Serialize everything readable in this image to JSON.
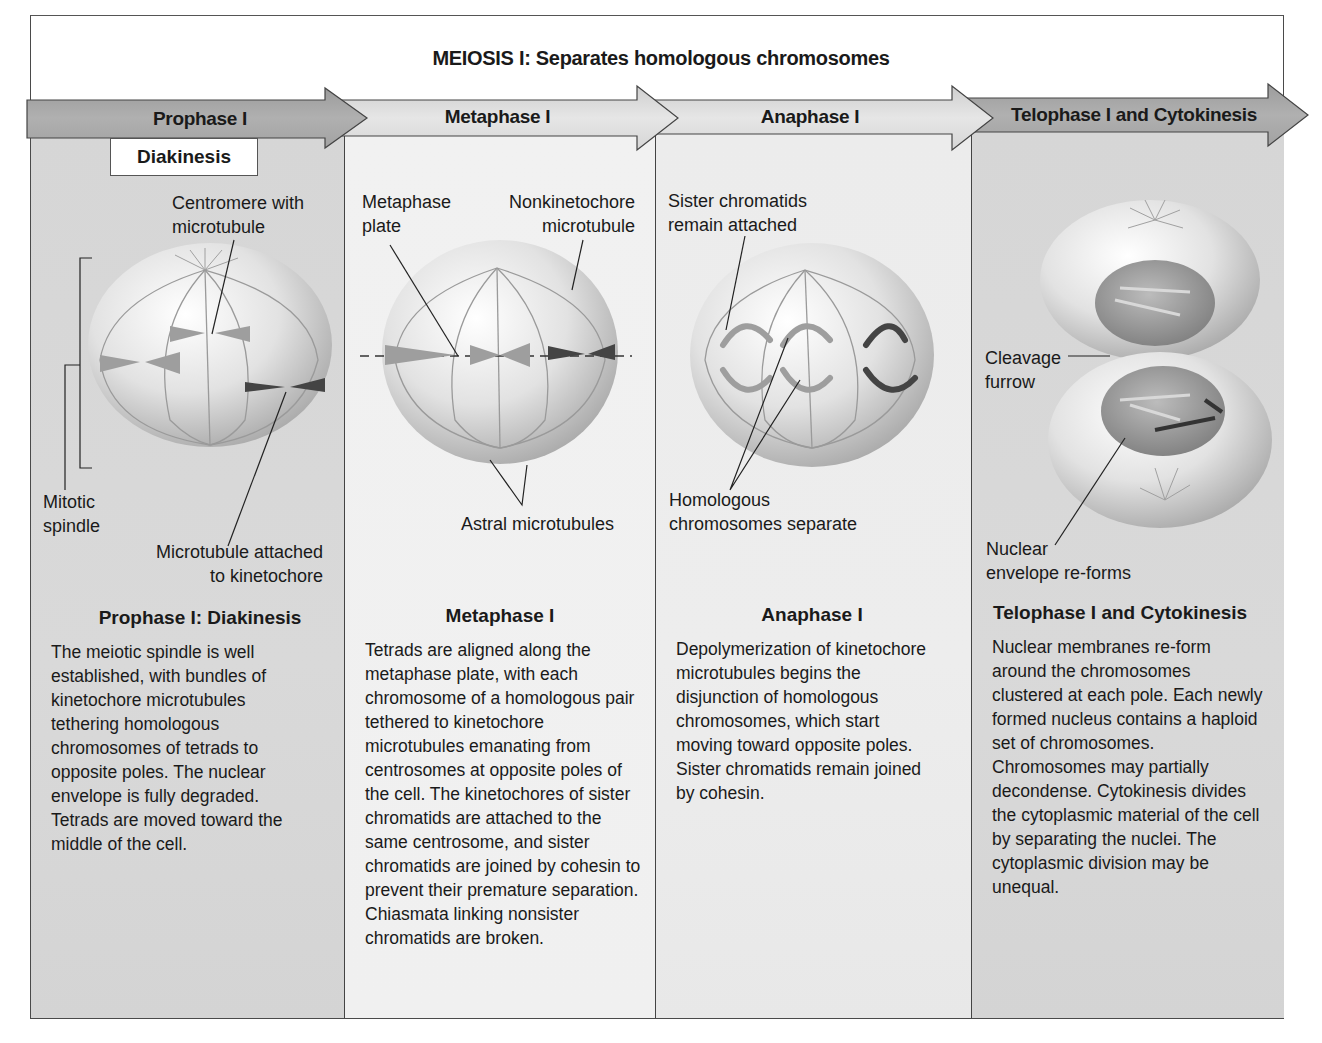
{
  "figure": {
    "title": "MEIOSIS I: Separates homologous chromosomes",
    "colors": {
      "frame_border": "#4a4a4a",
      "banner_dark": "#a9a9a9",
      "banner_light": "#dcdcdc",
      "column_dark": "#d6d6d6",
      "column_light": "#ececec",
      "text": "#1a1a1a"
    }
  },
  "stages": [
    {
      "banner": "Prophase I",
      "substage": "Diakinesis",
      "labels": {
        "centromere": "Centromere with\nmicrotubule",
        "spindle": "Mitotic\nspindle",
        "kinetochore": "Microtubule attached\nto kinetochore"
      },
      "desc_title": "Prophase I: Diakinesis",
      "desc": "The meiotic spindle is well established, with bundles of kinetochore microtubules tethering homologous chromosomes of tetrads to opposite poles. The nuclear envelope is fully degraded. Tetrads are moved toward the middle of the cell."
    },
    {
      "banner": "Metaphase I",
      "labels": {
        "plate": "Metaphase\nplate",
        "nonkinetochore": "Nonkinetochore\nmicrotubule",
        "astral": "Astral microtubules"
      },
      "desc_title": "Metaphase I",
      "desc": "Tetrads are aligned along the metaphase plate, with each chromosome of a homologous pair tethered to kinetochore microtubules emanating from centrosomes at opposite poles of the cell. The kinetochores of sister chromatids are attached to the same centrosome, and sister chromatids are joined by cohesin to prevent their premature separation. Chiasmata linking nonsister chromatids are broken."
    },
    {
      "banner": "Anaphase I",
      "labels": {
        "sister": "Sister chromatids\nremain attached",
        "homologous": "Homologous\nchromosomes separate"
      },
      "desc_title": "Anaphase I",
      "desc": "Depolymerization of kinetochore microtubules begins the disjunction of homologous chromosomes, which start moving toward opposite poles. Sister chromatids remain joined by cohesin."
    },
    {
      "banner": "Telophase I and Cytokinesis",
      "labels": {
        "cleavage": "Cleavage\nfurrow",
        "nuclear": "Nuclear\nenvelope re-forms"
      },
      "desc_title": "Telophase I and Cytokinesis",
      "desc": "Nuclear membranes re-form around the chromosomes clustered at each pole. Each newly formed nucleus contains a haploid set of chromosomes. Chromosomes may partially decondense. Cytokinesis divides the cytoplasmic material of the cell by separating the nuclei. The cytoplasmic division may be unequal."
    }
  ]
}
